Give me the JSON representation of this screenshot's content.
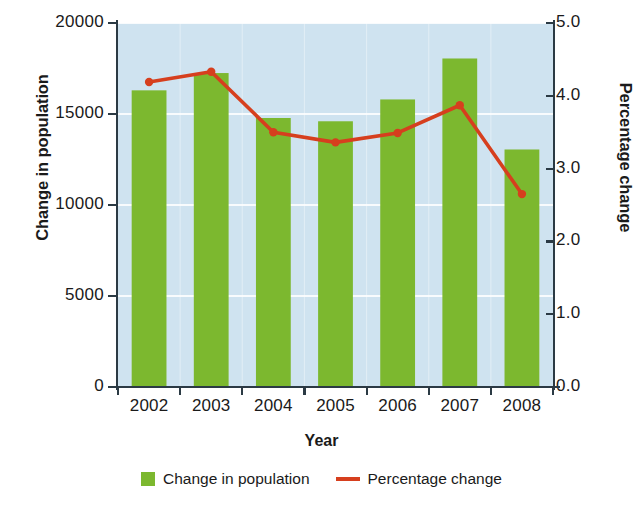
{
  "chart_data": {
    "type": "bar",
    "title": "",
    "subtitle": "",
    "xlabel": "Year",
    "ylabel": "Change in population",
    "y2label": "Percentage change",
    "categories": [
      "2002",
      "2003",
      "2004",
      "2005",
      "2006",
      "2007",
      "2008"
    ],
    "ylim": [
      0,
      20000
    ],
    "y2lim": [
      0.0,
      5.0
    ],
    "yticks": [
      "0",
      "5000",
      "10000",
      "15000",
      "20000"
    ],
    "ytick_values": [
      0,
      5000,
      10000,
      15000,
      20000
    ],
    "y2ticks": [
      "0.0",
      "1.0",
      "2.0",
      "3.0",
      "4.0",
      "5.0"
    ],
    "y2tick_values": [
      0.0,
      1.0,
      2.0,
      3.0,
      4.0,
      5.0
    ],
    "grid": "horizontal-white-faint",
    "legend_position": "bottom-center",
    "plot_background": "#cfe3f0",
    "series": [
      {
        "name": "Change in population",
        "type": "bar",
        "axis": "left",
        "color": "#7cb82f",
        "values": [
          16300,
          17250,
          14780,
          14600,
          15800,
          18050,
          13050
        ]
      },
      {
        "name": "Percentage change",
        "type": "line",
        "axis": "right",
        "color": "#d63f1e",
        "marker": "circle",
        "values": [
          4.19,
          4.33,
          3.5,
          3.36,
          3.49,
          3.87,
          2.65
        ]
      }
    ]
  },
  "legend": {
    "items": [
      {
        "label": "Change in population",
        "marker": "square",
        "color": "#7cb82f"
      },
      {
        "label": "Percentage change",
        "marker": "line",
        "color": "#d63f1e"
      }
    ]
  },
  "axes": {
    "left_title": "Change in population",
    "right_title": "Percentage change",
    "bottom_title": "Year"
  }
}
